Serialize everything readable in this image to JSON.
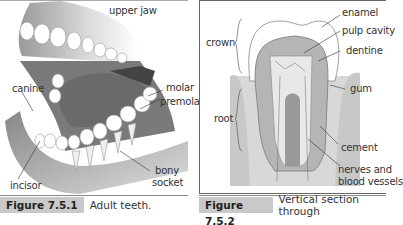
{
  "figures": [
    {
      "number": "Figure 7.5.1",
      "caption": "Adult teeth.",
      "labels": {
        "upper_jaw": "upper jaw",
        "canine": "canine",
        "molar": "molar",
        "premolar": "premolar",
        "incisor": "incisor",
        "bony_socket_1": "bony",
        "bony_socket_2": "socket"
      }
    },
    {
      "number": "Figure 7.5.2",
      "caption": "Vertical section through",
      "labels": {
        "enamel": "enamel",
        "pulp_cavity": "pulp cavity",
        "dentine": "dentine",
        "crown": "crown",
        "gum": "gum",
        "root": "root",
        "cement": "cement",
        "nerves_1": "nerves and",
        "nerves_2": "blood vessels"
      }
    }
  ],
  "colors": {
    "caption_bg": "#c9c9c9",
    "gum": "#9a9a9a",
    "tongue": "#6e6e6e",
    "dentine": "#b5b5b5",
    "pulp": "#e8e8e8"
  }
}
